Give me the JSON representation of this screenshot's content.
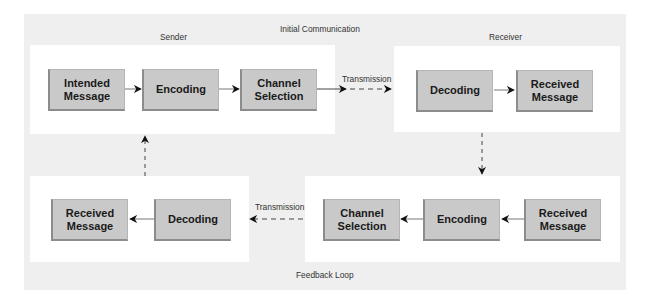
{
  "title": "Initial Communication",
  "footer": "Feedback Loop",
  "sections": {
    "sender": {
      "label": "Sender",
      "boxes": [
        "Intended Message",
        "Encoding",
        "Channel Selection"
      ]
    },
    "receiver": {
      "label": "Receiver",
      "boxes": [
        "Decoding",
        "Received Message"
      ]
    },
    "feedback_right": {
      "boxes": [
        "Received Message",
        "Encoding",
        "Channel Selection"
      ]
    },
    "feedback_left": {
      "boxes": [
        "Decoding",
        "Received Message"
      ]
    }
  },
  "transmissions": {
    "top": "Transmission",
    "bottom": "Transmission"
  },
  "colors": {
    "background": "#efefef",
    "panel": "#ffffff",
    "box_fill": "#c9c9c9",
    "box_shadow": "#8c8c8c",
    "text": "#1a1a1a"
  }
}
